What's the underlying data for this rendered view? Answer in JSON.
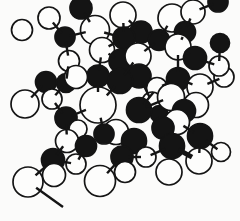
{
  "figure": {
    "background": "#fbfbfa",
    "ink": "#141414",
    "white_atom_fill": "#fdfdfc",
    "outline_width": 1.7,
    "bond_width": 2.4,
    "bond_tick_inset": 5
  },
  "molecule": {
    "atoms": [
      {
        "x": 49,
        "y": 18,
        "r": 11,
        "c": "w"
      },
      {
        "x": 22,
        "y": 30,
        "r": 10.5,
        "c": "w"
      },
      {
        "x": 81,
        "y": 8,
        "r": 11,
        "c": "b"
      },
      {
        "x": 65,
        "y": 37,
        "r": 10,
        "c": "b"
      },
      {
        "x": 123,
        "y": 15,
        "r": 13,
        "c": "w"
      },
      {
        "x": 95,
        "y": 30,
        "r": 14.5,
        "c": "w"
      },
      {
        "x": 141,
        "y": 32,
        "r": 11,
        "c": "b"
      },
      {
        "x": 124,
        "y": 38,
        "r": 11,
        "c": "b"
      },
      {
        "x": 159,
        "y": 40,
        "r": 10.5,
        "c": "b"
      },
      {
        "x": 172,
        "y": 18,
        "r": 14,
        "c": "w"
      },
      {
        "x": 218,
        "y": 2,
        "r": 10,
        "c": "b"
      },
      {
        "x": 193,
        "y": 12,
        "r": 12,
        "c": "w"
      },
      {
        "x": 185,
        "y": 32,
        "r": 10.5,
        "c": "b"
      },
      {
        "x": 178,
        "y": 47,
        "r": 13,
        "c": "w"
      },
      {
        "x": 195,
        "y": 58,
        "r": 11.5,
        "c": "b"
      },
      {
        "x": 220,
        "y": 43,
        "r": 9.5,
        "c": "b"
      },
      {
        "x": 69,
        "y": 61,
        "r": 10.5,
        "c": "w"
      },
      {
        "x": 66,
        "y": 83,
        "r": 9.5,
        "c": "b"
      },
      {
        "x": 102,
        "y": 50,
        "r": 12.5,
        "c": "w"
      },
      {
        "x": 121,
        "y": 61,
        "r": 12,
        "c": "b"
      },
      {
        "x": 138,
        "y": 56,
        "r": 13,
        "c": "w"
      },
      {
        "x": 139,
        "y": 76,
        "r": 12,
        "c": "b"
      },
      {
        "x": 120,
        "y": 81,
        "r": 12.5,
        "c": "b"
      },
      {
        "x": 98,
        "y": 76,
        "r": 11,
        "c": "b"
      },
      {
        "x": 76,
        "y": 77,
        "r": 11.5,
        "c": "w"
      },
      {
        "x": 46,
        "y": 82,
        "r": 10.5,
        "c": "b"
      },
      {
        "x": 52,
        "y": 99,
        "r": 10,
        "c": "w"
      },
      {
        "x": 25,
        "y": 104,
        "r": 14,
        "c": "w"
      },
      {
        "x": 66,
        "y": 118,
        "r": 11,
        "c": "b"
      },
      {
        "x": 157,
        "y": 88,
        "r": 10.5,
        "c": "w"
      },
      {
        "x": 152,
        "y": 102,
        "r": 10,
        "c": "w"
      },
      {
        "x": 159,
        "y": 114,
        "r": 8.5,
        "c": "b"
      },
      {
        "x": 139,
        "y": 110,
        "r": 12.5,
        "c": "b"
      },
      {
        "x": 178,
        "y": 79,
        "r": 11.5,
        "c": "b"
      },
      {
        "x": 224,
        "y": 77,
        "r": 10,
        "c": "w"
      },
      {
        "x": 219,
        "y": 66,
        "r": 10,
        "c": "w"
      },
      {
        "x": 200,
        "y": 87,
        "r": 13,
        "c": "w"
      },
      {
        "x": 171,
        "y": 97,
        "r": 13.5,
        "c": "w"
      },
      {
        "x": 196,
        "y": 105,
        "r": 12.5,
        "c": "w"
      },
      {
        "x": 184,
        "y": 111,
        "r": 11.5,
        "c": "b"
      },
      {
        "x": 177,
        "y": 122,
        "r": 12.5,
        "c": "w"
      },
      {
        "x": 163,
        "y": 128,
        "r": 11,
        "c": "b"
      },
      {
        "x": 98,
        "y": 105,
        "r": 18,
        "c": "w"
      },
      {
        "x": 78,
        "y": 129,
        "r": 9,
        "c": "w"
      },
      {
        "x": 67,
        "y": 141,
        "r": 11.5,
        "c": "w"
      },
      {
        "x": 116,
        "y": 132,
        "r": 12.5,
        "c": "w"
      },
      {
        "x": 104,
        "y": 134,
        "r": 10,
        "c": "b"
      },
      {
        "x": 134,
        "y": 141,
        "r": 12.5,
        "c": "b"
      },
      {
        "x": 86,
        "y": 146,
        "r": 10.5,
        "c": "b"
      },
      {
        "x": 122,
        "y": 157,
        "r": 11,
        "c": "b"
      },
      {
        "x": 146,
        "y": 157,
        "r": 10,
        "c": "w"
      },
      {
        "x": 200,
        "y": 136,
        "r": 12.5,
        "c": "b"
      },
      {
        "x": 172,
        "y": 146,
        "r": 12.5,
        "c": "b"
      },
      {
        "x": 221,
        "y": 152,
        "r": 9.5,
        "c": "w"
      },
      {
        "x": 199,
        "y": 161,
        "r": 13,
        "c": "w"
      },
      {
        "x": 169,
        "y": 172,
        "r": 13,
        "c": "w"
      },
      {
        "x": 53,
        "y": 160,
        "r": 11.5,
        "c": "b"
      },
      {
        "x": 76,
        "y": 164,
        "r": 10,
        "c": "w"
      },
      {
        "x": 54,
        "y": 175,
        "r": 11.5,
        "c": "w"
      },
      {
        "x": 28,
        "y": 182,
        "r": 15,
        "c": "w"
      },
      {
        "x": 125,
        "y": 172,
        "r": 10.5,
        "c": "w"
      },
      {
        "x": 100,
        "y": 181,
        "r": 15.5,
        "c": "w"
      }
    ],
    "bonds": [
      {
        "a": 0,
        "b": 3
      },
      {
        "a": 3,
        "b": 5
      },
      {
        "a": 3,
        "b": 16
      },
      {
        "a": 2,
        "b": 5
      },
      {
        "a": 4,
        "b": 7
      },
      {
        "a": 4,
        "b": 6
      },
      {
        "a": 7,
        "b": 5
      },
      {
        "a": 7,
        "b": 18
      },
      {
        "a": 18,
        "b": 23
      },
      {
        "a": 18,
        "b": 19
      },
      {
        "a": 8,
        "b": 20
      },
      {
        "a": 8,
        "b": 9
      },
      {
        "a": 9,
        "b": 12
      },
      {
        "a": 11,
        "b": 10
      },
      {
        "a": 11,
        "b": 12
      },
      {
        "a": 12,
        "b": 13
      },
      {
        "a": 13,
        "b": 14
      },
      {
        "a": 14,
        "b": 35
      },
      {
        "a": 15,
        "b": 35
      },
      {
        "a": 16,
        "b": 17
      },
      {
        "a": 17,
        "b": 26
      },
      {
        "a": 20,
        "b": 22
      },
      {
        "a": 21,
        "b": 30
      },
      {
        "a": 23,
        "b": 42
      },
      {
        "a": 22,
        "b": 42
      },
      {
        "a": 25,
        "b": 27
      },
      {
        "a": 28,
        "b": 26
      },
      {
        "a": 28,
        "b": 44
      },
      {
        "a": 28,
        "b": 42
      },
      {
        "a": 32,
        "b": 29
      },
      {
        "a": 32,
        "b": 37
      },
      {
        "a": 33,
        "b": 36
      },
      {
        "a": 33,
        "b": 29
      },
      {
        "a": 33,
        "b": 13
      },
      {
        "a": 36,
        "b": 34
      },
      {
        "a": 40,
        "b": 51
      },
      {
        "a": 51,
        "b": 54
      },
      {
        "a": 51,
        "b": 53
      },
      {
        "a": 52,
        "b": 54,
        "w": 4.8
      },
      {
        "a": 52,
        "b": 50
      },
      {
        "a": 50,
        "b": 49
      },
      {
        "a": 49,
        "b": 61
      },
      {
        "a": 42,
        "b": 46
      },
      {
        "a": 48,
        "b": 57
      },
      {
        "a": 56,
        "b": 57
      },
      {
        "a": 56,
        "b": 59
      },
      {
        "a": 56,
        "b": 44
      },
      {
        "a": 59,
        "x": 63,
        "y": 207
      }
    ]
  }
}
